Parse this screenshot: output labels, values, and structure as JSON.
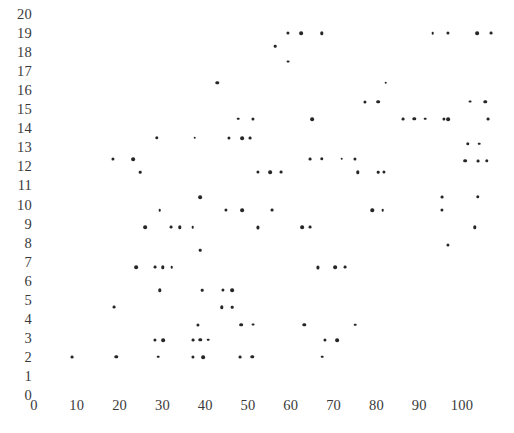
{
  "chart_data": {
    "type": "scatter",
    "title": "",
    "xlabel": "",
    "ylabel": "",
    "xlim": [
      0,
      107
    ],
    "ylim": [
      0,
      20
    ],
    "grid": false,
    "legend": null,
    "x_ticks": [
      0,
      10,
      20,
      30,
      40,
      50,
      60,
      70,
      80,
      90,
      100
    ],
    "x_tick_labels": [
      "0",
      "10",
      "20",
      "30",
      "40",
      "50",
      "60",
      "70",
      "80",
      "90",
      "100"
    ],
    "y_ticks": [
      0,
      1,
      2,
      3,
      4,
      5,
      6,
      7,
      8,
      9,
      10,
      11,
      12,
      13,
      14,
      15,
      16,
      17,
      18,
      19,
      20
    ],
    "y_tick_labels": [
      "0",
      "1",
      "2",
      "3",
      "4",
      "5",
      "6",
      "7",
      "8",
      "9",
      "10",
      "11",
      "12",
      "13",
      "14",
      "15",
      "16",
      "17",
      "18",
      "19",
      "20"
    ],
    "marker": "dot",
    "marker_color": "#262626",
    "points": [
      [
        56.3,
        18.3
      ],
      [
        59.3,
        19.0
      ],
      [
        62.4,
        19.0
      ],
      [
        59.3,
        17.5
      ],
      [
        67.3,
        19.0
      ],
      [
        93.2,
        19.0
      ],
      [
        96.7,
        19.0
      ],
      [
        103.5,
        19.0
      ],
      [
        106.8,
        19.0
      ],
      [
        42.8,
        16.4
      ],
      [
        82.2,
        16.4
      ],
      [
        77.3,
        15.4
      ],
      [
        80.4,
        15.4
      ],
      [
        101.9,
        15.4
      ],
      [
        105.4,
        15.4
      ],
      [
        47.7,
        14.5
      ],
      [
        51.2,
        14.5
      ],
      [
        64.9,
        14.5
      ],
      [
        86.2,
        14.5
      ],
      [
        88.8,
        14.5
      ],
      [
        91.4,
        14.5
      ],
      [
        95.8,
        14.5
      ],
      [
        96.7,
        14.5
      ],
      [
        106.1,
        14.5
      ],
      [
        28.7,
        13.5
      ],
      [
        37.6,
        13.5
      ],
      [
        45.6,
        13.5
      ],
      [
        48.6,
        13.5
      ],
      [
        50.5,
        13.5
      ],
      [
        101.4,
        13.2
      ],
      [
        104.0,
        13.2
      ],
      [
        18.5,
        12.4
      ],
      [
        23.1,
        12.4
      ],
      [
        64.5,
        12.4
      ],
      [
        67.3,
        12.4
      ],
      [
        71.9,
        12.4
      ],
      [
        75.0,
        12.4
      ],
      [
        100.7,
        12.3
      ],
      [
        103.7,
        12.3
      ],
      [
        105.8,
        12.3
      ],
      [
        24.8,
        11.7
      ],
      [
        52.3,
        11.7
      ],
      [
        55.1,
        11.7
      ],
      [
        57.7,
        11.7
      ],
      [
        75.7,
        11.7
      ],
      [
        80.4,
        11.7
      ],
      [
        81.8,
        11.7
      ],
      [
        38.8,
        10.4
      ],
      [
        95.3,
        10.4
      ],
      [
        103.7,
        10.4
      ],
      [
        29.4,
        9.7
      ],
      [
        44.9,
        9.7
      ],
      [
        48.6,
        9.7
      ],
      [
        55.6,
        9.7
      ],
      [
        79.0,
        9.7
      ],
      [
        81.5,
        9.7
      ],
      [
        95.3,
        9.7
      ],
      [
        25.9,
        8.8
      ],
      [
        32.0,
        8.8
      ],
      [
        34.1,
        8.8
      ],
      [
        37.1,
        8.8
      ],
      [
        52.3,
        8.8
      ],
      [
        62.6,
        8.8
      ],
      [
        64.5,
        8.8
      ],
      [
        103.0,
        8.8
      ],
      [
        38.8,
        7.6
      ],
      [
        96.7,
        7.9
      ],
      [
        23.8,
        6.7
      ],
      [
        28.3,
        6.7
      ],
      [
        30.1,
        6.7
      ],
      [
        32.2,
        6.7
      ],
      [
        66.4,
        6.7
      ],
      [
        70.3,
        6.7
      ],
      [
        72.7,
        6.7
      ],
      [
        29.4,
        5.5
      ],
      [
        39.3,
        5.5
      ],
      [
        44.2,
        5.5
      ],
      [
        46.3,
        5.5
      ],
      [
        18.7,
        4.6
      ],
      [
        43.9,
        4.6
      ],
      [
        46.3,
        4.6
      ],
      [
        38.3,
        3.7
      ],
      [
        48.4,
        3.7
      ],
      [
        51.2,
        3.7
      ],
      [
        63.1,
        3.7
      ],
      [
        75.0,
        3.7
      ],
      [
        28.3,
        2.9
      ],
      [
        30.1,
        2.9
      ],
      [
        37.1,
        2.9
      ],
      [
        38.8,
        2.9
      ],
      [
        40.7,
        2.9
      ],
      [
        68.0,
        2.9
      ],
      [
        70.8,
        2.9
      ],
      [
        8.9,
        2.0
      ],
      [
        19.2,
        2.0
      ],
      [
        29.0,
        2.0
      ],
      [
        37.1,
        2.0
      ],
      [
        39.5,
        2.0
      ],
      [
        48.1,
        2.0
      ],
      [
        51.0,
        2.0
      ],
      [
        67.3,
        2.0
      ]
    ]
  },
  "axes": {
    "x_origin_px": 34,
    "y_origin_px": 395,
    "px_per_x_unit": 4.28,
    "px_per_y_unit": 19.05
  }
}
